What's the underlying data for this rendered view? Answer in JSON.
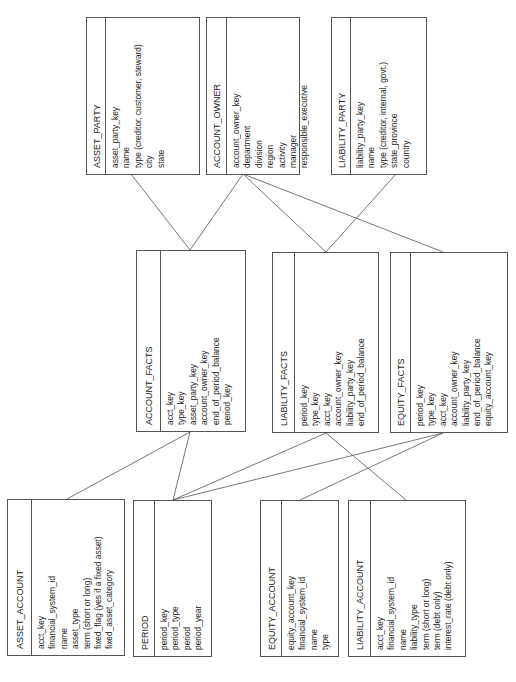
{
  "entities": {
    "asset_party": {
      "title": "ASSET_PARTY",
      "fields": [
        "asset_party_key",
        "name",
        "type (creditor, customer, steward)",
        "city",
        "state"
      ],
      "box": {
        "x": 86,
        "y": 17,
        "w": 114,
        "h": 158,
        "head": 19
      }
    },
    "account_owner": {
      "title": "ACCOUNT_OWNER",
      "fields": [
        "account_owner_key",
        "department",
        "division",
        "region",
        "activity",
        "manager",
        "responsible_executive"
      ],
      "box": {
        "x": 206,
        "y": 17,
        "w": 94,
        "h": 158,
        "head": 20
      }
    },
    "liability_party": {
      "title": "LIABILITY_PARTY",
      "fields": [
        "liability_party_key",
        "name",
        "type (creditor, internal, govt.)",
        "state_province",
        "country"
      ],
      "box": {
        "x": 331,
        "y": 17,
        "w": 96,
        "h": 158,
        "head": 19
      }
    },
    "account_facts": {
      "title": "ACCOUNT_FACTS",
      "fields": [
        "acct_key",
        "type_key",
        "asset_party_key",
        "account_owner_key",
        "end_of_period_balance",
        "period_key"
      ],
      "box": {
        "x": 136,
        "y": 250,
        "w": 110,
        "h": 182,
        "head": 24
      }
    },
    "liability_facts": {
      "title": "LIABILITY_FACTS",
      "fields": [
        "period_key",
        "type_key",
        "acct_key",
        "account_owner_key",
        "liability_party_key",
        "end_of_period_balance"
      ],
      "box": {
        "x": 272,
        "y": 252,
        "w": 107,
        "h": 181,
        "head": 22
      }
    },
    "equity_facts": {
      "title": "EQUITY_FACTS",
      "fields": [
        "period_key",
        "type_key",
        "acct_key",
        "account_owner_key",
        "liability_party_key",
        "end_of_period_balance",
        "equity_account_key"
      ],
      "box": {
        "x": 390,
        "y": 252,
        "w": 118,
        "h": 181,
        "head": 20
      }
    },
    "asset_account": {
      "title": "ASSET_ACCOUNT",
      "fields": [
        "acct_key",
        "financial_system_id",
        "name",
        "asset_type",
        "term (short or long)",
        "fixed_flag (yes if a fixed asset)",
        "fixed_asset_category"
      ],
      "box": {
        "x": 7,
        "y": 499,
        "w": 118,
        "h": 157,
        "head": 24
      }
    },
    "period": {
      "title": "PERIOD",
      "fields": [
        "period_key",
        "period_type",
        "period",
        "period_year"
      ],
      "box": {
        "x": 133,
        "y": 500,
        "w": 79,
        "h": 157,
        "head": 21
      }
    },
    "equity_account": {
      "title": "EQUITY_ACCOUNT",
      "fields": [
        "equity_account_key",
        "financial_system_id",
        "name",
        "type"
      ],
      "box": {
        "x": 260,
        "y": 500,
        "w": 79,
        "h": 157,
        "head": 21
      }
    },
    "liability_account": {
      "title": "LIABILITY_ACCOUNT",
      "fields": [
        "acct_key",
        "financial_system_id",
        "name",
        "liability_type",
        "term (short or long)",
        "term (debt only)",
        "interest_rate (debt only)"
      ],
      "box": {
        "x": 348,
        "y": 500,
        "w": 118,
        "h": 157,
        "head": 22
      }
    }
  },
  "relationships": [
    {
      "from": "asset_party",
      "to": "account_facts",
      "x1": 131,
      "y1": 174,
      "x2": 190,
      "y2": 250
    },
    {
      "from": "account_owner",
      "to": "account_facts",
      "x1": 243,
      "y1": 174,
      "x2": 190,
      "y2": 250
    },
    {
      "from": "account_owner",
      "to": "liability_facts",
      "x1": 243,
      "y1": 174,
      "x2": 326,
      "y2": 252
    },
    {
      "from": "account_owner",
      "to": "equity_facts",
      "x1": 243,
      "y1": 174,
      "x2": 443,
      "y2": 252
    },
    {
      "from": "liability_party",
      "to": "liability_facts",
      "x1": 396,
      "y1": 174,
      "x2": 326,
      "y2": 252
    },
    {
      "from": "account_facts",
      "to": "asset_account",
      "x1": 190,
      "y1": 432,
      "x2": 67,
      "y2": 499
    },
    {
      "from": "account_facts",
      "to": "period",
      "x1": 190,
      "y1": 432,
      "x2": 173,
      "y2": 500
    },
    {
      "from": "liability_facts",
      "to": "period",
      "x1": 326,
      "y1": 433,
      "x2": 173,
      "y2": 500
    },
    {
      "from": "equity_facts",
      "to": "period",
      "x1": 443,
      "y1": 433,
      "x2": 173,
      "y2": 500
    },
    {
      "from": "equity_facts",
      "to": "equity_account",
      "x1": 443,
      "y1": 433,
      "x2": 300,
      "y2": 500
    },
    {
      "from": "liability_facts",
      "to": "liability_account",
      "x1": 326,
      "y1": 433,
      "x2": 406,
      "y2": 500
    }
  ]
}
